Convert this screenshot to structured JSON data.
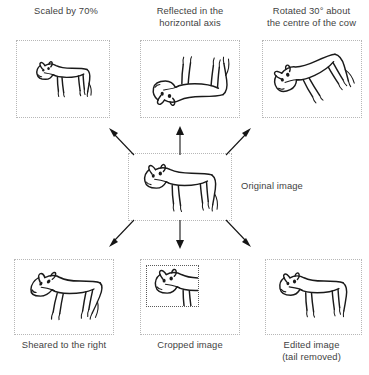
{
  "figure": {
    "background_color": "#ffffff",
    "ink_color": "#1a1a1a",
    "frame_color": "#b7b7b7",
    "text_color": "#3f3f3f"
  },
  "center": {
    "label": "Original image",
    "icon": "cow-drawing-icon"
  },
  "panels": [
    {
      "id": "scaled",
      "label": "Scaled by 70%",
      "label_position": "above",
      "icon": "cow-drawing-icon",
      "transform": "scale 70%"
    },
    {
      "id": "reflected",
      "label": "Reflected in the\nhorizontal axis",
      "label_position": "above",
      "icon": "cow-drawing-icon",
      "transform": "vertical flip"
    },
    {
      "id": "rotated",
      "label": "Rotated 30° about\nthe centre of the cow",
      "label_position": "above",
      "icon": "cow-drawing-icon",
      "transform": "rotate 30 degrees"
    },
    {
      "id": "sheared",
      "label": "Sheared to the right",
      "label_position": "below",
      "icon": "cow-drawing-icon",
      "transform": "horizontal shear"
    },
    {
      "id": "cropped",
      "label": "Cropped image",
      "label_position": "below",
      "icon": "cow-drawing-icon",
      "transform": "crop to front portion"
    },
    {
      "id": "edited",
      "label": "Edited image\n(tail removed)",
      "label_position": "below",
      "icon": "cow-drawing-icon",
      "transform": "tail removed"
    }
  ],
  "arrows": [
    {
      "id": "arrow-up-left",
      "direction": "up-left"
    },
    {
      "id": "arrow-up",
      "direction": "up"
    },
    {
      "id": "arrow-up-right",
      "direction": "up-right"
    },
    {
      "id": "arrow-down-left",
      "direction": "down-left"
    },
    {
      "id": "arrow-down",
      "direction": "down"
    },
    {
      "id": "arrow-down-right",
      "direction": "down-right"
    }
  ]
}
